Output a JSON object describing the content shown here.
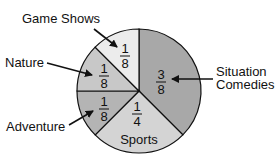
{
  "chart_data": {
    "type": "pie",
    "title": "",
    "categories": [
      "Situation Comedies",
      "Sports",
      "Adventure",
      "Nature",
      "Game Shows"
    ],
    "values": [
      0.375,
      0.25,
      0.125,
      0.125,
      0.125
    ],
    "fraction_labels": [
      "3/8",
      "1/4",
      "1/8",
      "1/8",
      "1/8"
    ],
    "start_angle_deg": -90,
    "direction": "clockwise",
    "legend": "none (callout labels with arrows)"
  },
  "slices": [
    {
      "name": "Situation Comedies",
      "num": "3",
      "den": "8",
      "color": "#a8a8a8",
      "start": -90,
      "end": 45
    },
    {
      "name": "Sports",
      "num": "1",
      "den": "4",
      "color": "#d4d4d4",
      "start": 45,
      "end": 135
    },
    {
      "name": "Adventure",
      "num": "1",
      "den": "8",
      "color": "#b4b4b4",
      "start": 135,
      "end": 180
    },
    {
      "name": "Nature",
      "num": "1",
      "den": "8",
      "color": "#c8c8c8",
      "start": 180,
      "end": 225
    },
    {
      "name": "Game Shows",
      "num": "1",
      "den": "8",
      "color": "#ececec",
      "start": 225,
      "end": 270
    }
  ],
  "labels": {
    "game_shows": "Game Shows",
    "nature": "Nature",
    "adventure": "Adventure",
    "sitcom_line1": "Situation",
    "sitcom_line2": "Comedies",
    "sports": "Sports"
  }
}
